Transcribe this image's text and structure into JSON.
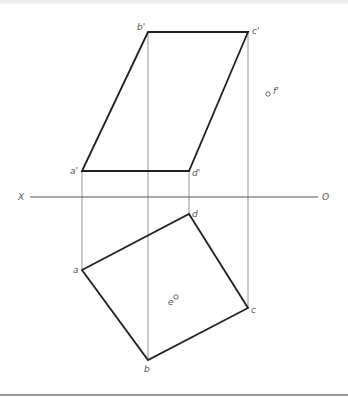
{
  "drawing": {
    "type": "orthographic-projection",
    "axis": {
      "left_label": "X",
      "right_label": "O",
      "y": 197,
      "x_start": 30,
      "x_end": 318
    },
    "front_view": {
      "vertices": [
        {
          "name": "a'",
          "label": "a'",
          "x": 82,
          "y": 171
        },
        {
          "name": "b'",
          "label": "b'",
          "x": 148,
          "y": 32
        },
        {
          "name": "c'",
          "label": "c'",
          "x": 248,
          "y": 32
        },
        {
          "name": "d'",
          "label": "d'",
          "x": 189,
          "y": 171
        }
      ],
      "point_f": {
        "label": "f'",
        "x": 268,
        "y": 94
      }
    },
    "top_view": {
      "vertices": [
        {
          "name": "a",
          "label": "a",
          "x": 82,
          "y": 270
        },
        {
          "name": "b",
          "label": "b",
          "x": 148,
          "y": 360
        },
        {
          "name": "c",
          "label": "c",
          "x": 248,
          "y": 308
        },
        {
          "name": "d",
          "label": "d",
          "x": 189,
          "y": 214
        }
      ],
      "point_e": {
        "label": "e",
        "x": 175,
        "y": 298
      }
    },
    "colors": {
      "outline": "#222222",
      "projection_line": "#8a8a8a",
      "label": "#555555"
    }
  }
}
